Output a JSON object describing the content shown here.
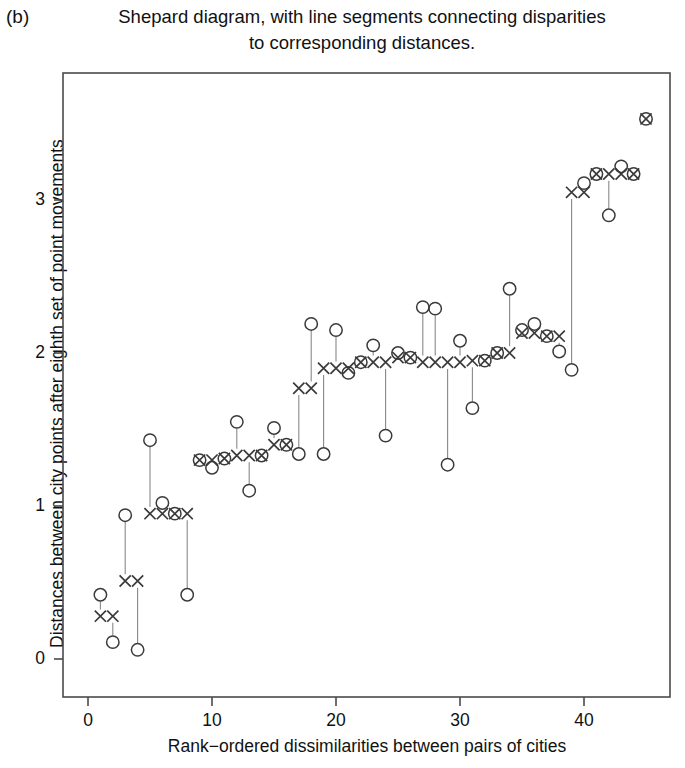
{
  "panel": {
    "label": "(b)"
  },
  "title": {
    "line1": "Shepard diagram, with line segments connecting disparities",
    "line2": "to corresponding distances."
  },
  "axes": {
    "xlabel": "Rank−ordered dissimilarities between pairs of cities",
    "ylabel": "Distances between city points after eighth set of point movements",
    "xticks": [
      "0",
      "10",
      "20",
      "30",
      "40"
    ],
    "yticks": [
      "0",
      "1",
      "2",
      "3"
    ]
  },
  "chart_data": {
    "type": "scatter",
    "title": "Shepard diagram, with line segments connecting disparities to corresponding distances.",
    "xlabel": "Rank-ordered dissimilarities between pairs of cities",
    "ylabel": "Distances between city points after eighth set of point movements",
    "xlim": [
      -0.5,
      46.5
    ],
    "ylim": [
      -0.22,
      3.82
    ],
    "xticks": [
      0,
      10,
      20,
      30,
      40
    ],
    "yticks": [
      0,
      1,
      2,
      3
    ],
    "grid": false,
    "legend": null,
    "series": [
      {
        "name": "distances",
        "marker": "circle",
        "color": "#333333",
        "x": [
          1,
          2,
          3,
          4,
          5,
          6,
          7,
          8,
          9,
          10,
          11,
          12,
          13,
          14,
          15,
          16,
          17,
          18,
          19,
          20,
          21,
          22,
          23,
          24,
          25,
          26,
          27,
          28,
          29,
          30,
          31,
          32,
          33,
          34,
          35,
          36,
          37,
          38,
          39,
          40,
          41,
          42,
          43,
          44
        ],
        "y": [
          0.42,
          0.11,
          0.94,
          0.06,
          1.43,
          1.02,
          0.95,
          0.42,
          1.3,
          1.25,
          1.31,
          1.55,
          1.1,
          1.33,
          1.51,
          1.4,
          1.34,
          2.19,
          1.34,
          2.15,
          1.87,
          1.94,
          2.05,
          1.46,
          2.0,
          1.97,
          2.3,
          2.29,
          1.27,
          2.08,
          1.64,
          1.95,
          2.0,
          2.42,
          2.15,
          2.19,
          2.11,
          2.01,
          1.89,
          3.11,
          3.17,
          2.9,
          3.22,
          3.17
        ]
      },
      {
        "name": "disparities",
        "marker": "x",
        "color": "#333333",
        "x": [
          1,
          2,
          3,
          4,
          5,
          6,
          7,
          8,
          9,
          10,
          11,
          12,
          13,
          14,
          15,
          16,
          17,
          18,
          19,
          20,
          21,
          22,
          23,
          24,
          25,
          26,
          27,
          28,
          29,
          30,
          31,
          32,
          33,
          34,
          35,
          36,
          37,
          38,
          39,
          40,
          41,
          42,
          43,
          44
        ],
        "y": [
          0.28,
          0.28,
          0.51,
          0.51,
          0.95,
          0.95,
          0.95,
          0.95,
          1.3,
          1.3,
          1.31,
          1.33,
          1.33,
          1.33,
          1.4,
          1.4,
          1.77,
          1.77,
          1.9,
          1.9,
          1.9,
          1.94,
          1.94,
          1.94,
          1.97,
          1.97,
          1.94,
          1.94,
          1.94,
          1.94,
          1.95,
          1.95,
          2.0,
          2.0,
          2.13,
          2.13,
          2.11,
          2.11,
          3.05,
          3.05,
          3.17,
          3.17,
          3.17,
          3.17
        ]
      }
    ],
    "extra_points": [
      {
        "x": 45,
        "y": 3.53,
        "marker": "circle-x"
      }
    ]
  }
}
